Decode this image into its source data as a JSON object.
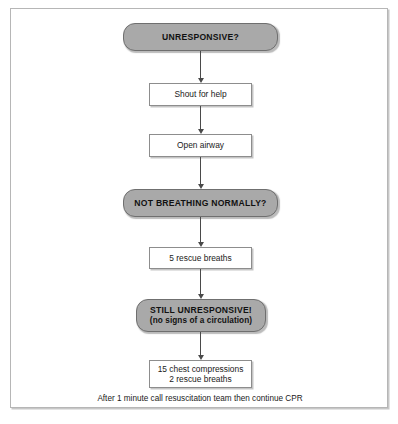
{
  "figure": {
    "background_color": "#ffffff",
    "frame_border_color": "#b6b6b6"
  },
  "colors": {
    "decision_fill": "#a9a9a9",
    "decision_border": "#6f6f6f",
    "action_fill": "#ffffff",
    "action_border": "#8d8d8d",
    "connector": "#4a4a4a",
    "text": "#1a1a1a"
  },
  "nodes": [
    {
      "id": "unresponsive",
      "shape": "rounded",
      "label": "UNRESPONSIVE?",
      "sublabel": ""
    },
    {
      "id": "shout-for-help",
      "shape": "rect",
      "label": "Shout for help",
      "label2": ""
    },
    {
      "id": "open-airway",
      "shape": "rect",
      "label": "Open airway",
      "label2": ""
    },
    {
      "id": "not-breathing-normally",
      "shape": "rounded",
      "label": "NOT BREATHING NORMALLY?",
      "sublabel": ""
    },
    {
      "id": "rescue-breaths",
      "shape": "rect",
      "label": "5 rescue breaths",
      "label2": ""
    },
    {
      "id": "still-unresponsive",
      "shape": "rounded",
      "label": "STILL UNRESPONSIVE!",
      "sublabel": "(no signs of a circulation)"
    },
    {
      "id": "compressions",
      "shape": "rect",
      "label": "15 chest compressions",
      "label2": "2 rescue breaths"
    }
  ],
  "caption": {
    "text": "After 1 minute call resuscitation team then continue CPR"
  }
}
